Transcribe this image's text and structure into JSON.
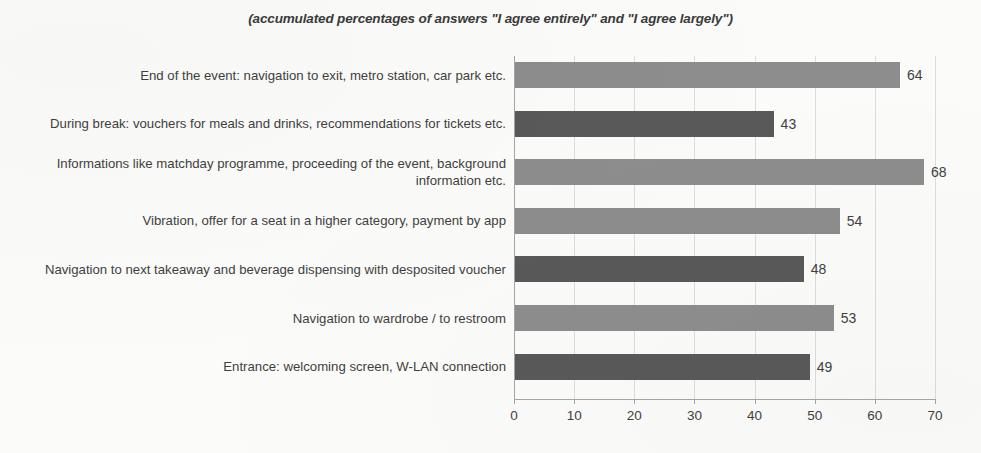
{
  "chart_data": {
    "type": "bar",
    "orientation": "horizontal",
    "title": "",
    "subtitle": "(accumulated percentages of answers \"I agree entirely\" and \"I agree largely\")",
    "xlabel": "",
    "ylabel": "",
    "xlim": [
      0,
      70
    ],
    "xticks": [
      "0",
      "10",
      "20",
      "30",
      "40",
      "50",
      "60",
      "70"
    ],
    "xtick_values": [
      0,
      10,
      20,
      30,
      40,
      50,
      60,
      70
    ],
    "grid": "vertical",
    "legend": "none",
    "categories": [
      "End of the event: navigation to exit, metro station, car park etc.",
      "During break: vouchers for meals and drinks,  recommendations for tickets etc.",
      "Informations like matchday programme, proceeding of the event, background information etc.",
      "Vibration, offer for a seat in a higher category, payment by app",
      "Navigation to next takeaway and beverage dispensing with desposited voucher",
      "Navigation to wardrobe / to restroom",
      "Entrance: welcoming screen, W-LAN connection"
    ],
    "values": [
      64,
      43,
      68,
      54,
      48,
      53,
      49
    ],
    "value_labels": [
      "64",
      "43",
      "68",
      "54",
      "48",
      "53",
      "49"
    ],
    "bar_colors": [
      "#8d8d8d",
      "#595959",
      "#8d8d8d",
      "#8d8d8d",
      "#595959",
      "#8d8d8d",
      "#595959"
    ],
    "colors": {
      "bar_light": "#8d8d8d",
      "bar_dark": "#595959",
      "gridline": "#dcdcdc",
      "axis": "#a6a6a6",
      "text": "#3f3f3f",
      "background": "#fbfbf9"
    }
  }
}
